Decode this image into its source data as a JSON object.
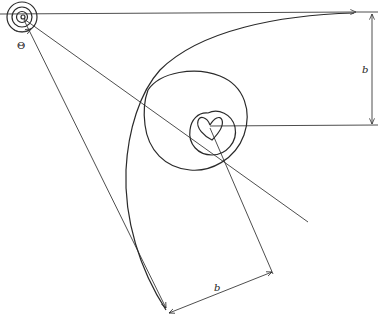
{
  "diagram": {
    "labels": {
      "angle": "Θ",
      "dimension_vertical": "b",
      "dimension_bottom": "b"
    },
    "colors": {
      "stroke": "#2a2a2a",
      "background": "#ffffff"
    }
  }
}
